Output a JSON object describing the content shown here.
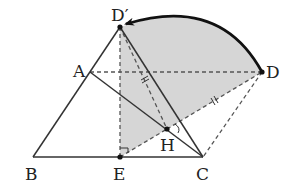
{
  "figure": {
    "points": {
      "D_prime": {
        "label": "D′",
        "x": 120,
        "y": 27
      },
      "A": {
        "label": "A",
        "x": 90,
        "y": 72
      },
      "D": {
        "label": "D",
        "x": 262,
        "y": 72
      },
      "B": {
        "label": "B",
        "x": 33,
        "y": 157
      },
      "E": {
        "label": "E",
        "x": 120,
        "y": 157
      },
      "C": {
        "label": "C",
        "x": 203,
        "y": 157
      },
      "H": {
        "label": "H",
        "x": 167,
        "y": 129
      }
    },
    "labels": {
      "D_prime": "D′",
      "A": "A",
      "D": "D",
      "B": "B",
      "E": "E",
      "C": "C",
      "H": "H"
    },
    "colors": {
      "shade": "#d6d6d6",
      "line": "#333333",
      "arc": "#111111"
    },
    "segments_solid": [
      "B-D′",
      "B-C",
      "A-C",
      "D′-C"
    ],
    "segments_dashed": [
      "D′-E",
      "A-D",
      "D′-H",
      "H-D",
      "D-C",
      "E-H"
    ],
    "equal_marks": [
      "D′-H",
      "H-D"
    ],
    "right_angle_at": "E",
    "arc": {
      "from": "D",
      "to": "D′",
      "arrow_at": "D′"
    }
  }
}
